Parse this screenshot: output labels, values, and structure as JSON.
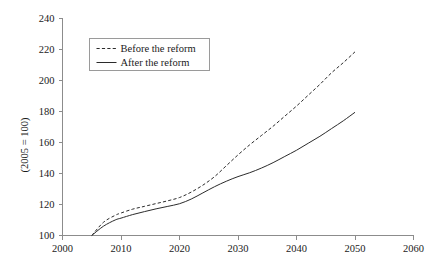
{
  "chart_data": {
    "type": "line",
    "title": "",
    "subtitle": "",
    "xlabel": "",
    "ylabel": "(2005 = 100)",
    "xlim": [
      2000,
      2060
    ],
    "ylim": [
      100,
      240
    ],
    "xticks": [
      2000,
      2010,
      2020,
      2030,
      2040,
      2050,
      2060
    ],
    "yticks": [
      100,
      120,
      140,
      160,
      180,
      200,
      220,
      240
    ],
    "xtick_labels": [
      "2000",
      "2010",
      "2020",
      "2030",
      "2040",
      "2050",
      "2060"
    ],
    "ytick_labels": [
      "100",
      "120",
      "140",
      "160",
      "180",
      "200",
      "220",
      "240"
    ],
    "grid": false,
    "legend_position": "upper-left-inside",
    "x": [
      2005,
      2007,
      2009,
      2010,
      2012,
      2014,
      2016,
      2018,
      2020,
      2022,
      2024,
      2026,
      2028,
      2030,
      2032,
      2034,
      2036,
      2038,
      2040,
      2042,
      2044,
      2046,
      2048,
      2050
    ],
    "series": [
      {
        "name": "Before the reform",
        "style": "dashed",
        "color": "#2b2b2b",
        "values": [
          100.0,
          108.5,
          113.0,
          114.5,
          117.0,
          118.8,
          120.6,
          122.4,
          124.5,
          128.0,
          132.5,
          138.0,
          145.0,
          152.0,
          158.5,
          164.5,
          170.5,
          177.0,
          183.5,
          190.5,
          197.5,
          205.0,
          211.5,
          218.5
        ]
      },
      {
        "name": "After the reform",
        "style": "solid",
        "color": "#2b2b2b",
        "values": [
          100.0,
          106.0,
          110.0,
          111.2,
          113.5,
          115.4,
          117.2,
          118.8,
          120.5,
          123.5,
          127.5,
          131.5,
          135.0,
          138.0,
          140.5,
          143.5,
          147.0,
          151.0,
          155.0,
          159.5,
          164.0,
          169.0,
          174.0,
          179.5
        ]
      }
    ]
  },
  "legend": {
    "items": [
      {
        "label": "Before the reform",
        "style": "dashed"
      },
      {
        "label": "After the reform",
        "style": "solid"
      }
    ]
  }
}
